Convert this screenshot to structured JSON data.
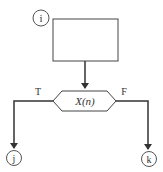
{
  "diagram": {
    "entry_connector": {
      "label": "i"
    },
    "process_box": {
      "label": ""
    },
    "decision": {
      "label": "X(n)"
    },
    "true_branch": {
      "label": "T"
    },
    "false_branch": {
      "label": "F"
    },
    "true_connector": {
      "label": "j"
    },
    "false_connector": {
      "label": "k"
    }
  },
  "colors": {
    "stroke": "#333333",
    "background": "#ffffff"
  }
}
